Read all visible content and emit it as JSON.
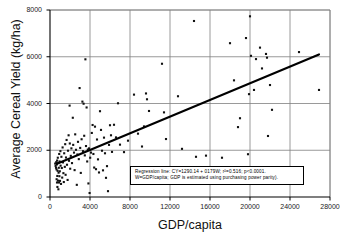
{
  "chart_data": {
    "type": "scatter",
    "title": "",
    "xlabel": "GDP/capita",
    "ylabel": "Average Cereal Yield (kg/ha)",
    "xlim": [
      0,
      28000
    ],
    "ylim": [
      0,
      8000
    ],
    "xticks": [
      "0",
      "4000",
      "8000",
      "12000",
      "16000",
      "20000",
      "24000",
      "28000"
    ],
    "yticks": [
      "0",
      "2000",
      "4000",
      "6000",
      "8000"
    ],
    "xtick_values": [
      0,
      4000,
      8000,
      12000,
      16000,
      20000,
      24000,
      28000
    ],
    "ytick_values": [
      0,
      2000,
      4000,
      6000,
      8000
    ],
    "grid": "both",
    "legend": "none",
    "marker": "square",
    "marker_color": "#111111",
    "annotation_box": {
      "line1": "Regression line: CY=1290.14 + 0179W; r²=0.516; p<0.0001.",
      "line2": "W=GDP/capita; GDP is estimated using purchasing power parity)."
    },
    "regression": {
      "intercept": 1290.14,
      "slope": 0.179,
      "r_squared": 0.516,
      "p_value": "<0.0001",
      "x_start": 700,
      "x_end": 26900,
      "y_start": 1420,
      "y_end": 6100
    },
    "series": [
      {
        "name": "Countries",
        "points": [
          [
            520,
            1430
          ],
          [
            560,
            1330
          ],
          [
            600,
            1250
          ],
          [
            620,
            1490
          ],
          [
            650,
            1180
          ],
          [
            660,
            760
          ],
          [
            680,
            1390
          ],
          [
            700,
            620
          ],
          [
            710,
            1560
          ],
          [
            730,
            900
          ],
          [
            740,
            430
          ],
          [
            760,
            1120
          ],
          [
            780,
            1680
          ],
          [
            800,
            700
          ],
          [
            820,
            1460
          ],
          [
            840,
            330
          ],
          [
            860,
            1040
          ],
          [
            880,
            1250
          ],
          [
            900,
            620
          ],
          [
            920,
            1840
          ],
          [
            940,
            890
          ],
          [
            960,
            1520
          ],
          [
            980,
            1100
          ],
          [
            1000,
            690
          ],
          [
            1040,
            1960
          ],
          [
            1060,
            1340
          ],
          [
            1100,
            560
          ],
          [
            1140,
            1720
          ],
          [
            1180,
            1240
          ],
          [
            1220,
            830
          ],
          [
            1260,
            2120
          ],
          [
            1300,
            1480
          ],
          [
            1340,
            1020
          ],
          [
            1380,
            640
          ],
          [
            1420,
            1870
          ],
          [
            1480,
            1290
          ],
          [
            1520,
            2260
          ],
          [
            1560,
            950
          ],
          [
            1600,
            1690
          ],
          [
            1660,
            2440
          ],
          [
            1700,
            1380
          ],
          [
            1760,
            730
          ],
          [
            1800,
            1980
          ],
          [
            1860,
            2640
          ],
          [
            1900,
            1550
          ],
          [
            1960,
            3910
          ],
          [
            1980,
            2290
          ],
          [
            2020,
            1210
          ],
          [
            2080,
            1760
          ],
          [
            2140,
            2080
          ],
          [
            2200,
            1450
          ],
          [
            2280,
            3390
          ],
          [
            2320,
            2230
          ],
          [
            2400,
            1900
          ],
          [
            2460,
            1150
          ],
          [
            2520,
            2680
          ],
          [
            2600,
            2020
          ],
          [
            2680,
            520
          ],
          [
            2740,
            1820
          ],
          [
            2800,
            2360
          ],
          [
            2880,
            1620
          ],
          [
            2960,
            4660
          ],
          [
            3020,
            2100
          ],
          [
            3080,
            1030
          ],
          [
            3160,
            2470
          ],
          [
            3240,
            4080
          ],
          [
            3300,
            1960
          ],
          [
            3360,
            3990
          ],
          [
            3420,
            2620
          ],
          [
            3480,
            1780
          ],
          [
            3540,
            5890
          ],
          [
            3600,
            2180
          ],
          [
            3660,
            3830
          ],
          [
            3720,
            1520
          ],
          [
            3780,
            2030
          ],
          [
            3840,
            580
          ],
          [
            3900,
            2080
          ],
          [
            3960,
            170
          ],
          [
            4020,
            1680
          ],
          [
            4100,
            1900
          ],
          [
            4180,
            2740
          ],
          [
            4260,
            3080
          ],
          [
            4340,
            1840
          ],
          [
            4420,
            1260
          ],
          [
            4500,
            3010
          ],
          [
            4600,
            1190
          ],
          [
            4700,
            2460
          ],
          [
            4800,
            1610
          ],
          [
            4900,
            1050
          ],
          [
            5000,
            3670
          ],
          [
            5100,
            2870
          ],
          [
            5200,
            1980
          ],
          [
            5300,
            1140
          ],
          [
            5400,
            2540
          ],
          [
            5500,
            1870
          ],
          [
            5600,
            820
          ],
          [
            5700,
            1320
          ],
          [
            5800,
            250
          ],
          [
            5900,
            2230
          ],
          [
            6000,
            3070
          ],
          [
            6100,
            2640
          ],
          [
            6200,
            1930
          ],
          [
            6400,
            3090
          ],
          [
            6600,
            2550
          ],
          [
            6800,
            4010
          ],
          [
            7000,
            2240
          ],
          [
            7400,
            1920
          ],
          [
            7800,
            2410
          ],
          [
            8400,
            4380
          ],
          [
            8800,
            2710
          ],
          [
            9200,
            2160
          ],
          [
            9400,
            3020
          ],
          [
            9600,
            4430
          ],
          [
            9700,
            4180
          ],
          [
            9900,
            3680
          ],
          [
            11200,
            5700
          ],
          [
            11400,
            3620
          ],
          [
            11600,
            2480
          ],
          [
            12800,
            4310
          ],
          [
            13200,
            2060
          ],
          [
            14400,
            7530
          ],
          [
            14600,
            1720
          ],
          [
            15600,
            1770
          ],
          [
            17200,
            1680
          ],
          [
            18000,
            6580
          ],
          [
            18400,
            4990
          ],
          [
            18800,
            2990
          ],
          [
            19000,
            3370
          ],
          [
            19600,
            6800
          ],
          [
            19800,
            1830
          ],
          [
            19900,
            4400
          ],
          [
            20000,
            7730
          ],
          [
            20100,
            6040
          ],
          [
            20400,
            4580
          ],
          [
            20600,
            5900
          ],
          [
            21000,
            6390
          ],
          [
            21200,
            5500
          ],
          [
            21600,
            6120
          ],
          [
            21700,
            5960
          ],
          [
            21800,
            2610
          ],
          [
            22000,
            4790
          ],
          [
            22200,
            3730
          ],
          [
            24900,
            6200
          ],
          [
            26900,
            4580
          ]
        ]
      }
    ]
  }
}
